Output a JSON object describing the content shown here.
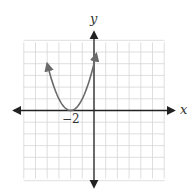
{
  "chart_data": {
    "type": "line",
    "title": "",
    "xlabel": "x",
    "ylabel": "y",
    "xlim": [
      -6,
      6
    ],
    "ylim": [
      -6,
      6
    ],
    "grid": true,
    "legend": "none",
    "tick_labels": [
      {
        "axis": "x",
        "value": -2,
        "label": "−2"
      }
    ],
    "series": [
      {
        "name": "parabola",
        "equation": "y = (x + 2)^2",
        "vertex": [
          -2,
          0
        ],
        "x": [
          -4.0,
          -3.5,
          -3.0,
          -2.5,
          -2.0,
          -1.5,
          -1.0,
          -0.5,
          0.0,
          0.2
        ],
        "y": [
          4.0,
          2.25,
          1.0,
          0.25,
          0.0,
          0.25,
          1.0,
          2.25,
          4.0,
          4.84
        ],
        "arrows_at_ends": true
      }
    ]
  },
  "labels": {
    "x_axis": "x",
    "y_axis": "y",
    "tick_neg2": "−2"
  },
  "colors": {
    "grid": "#d6d6d6",
    "axis": "#222222",
    "curve": "#6a6a6a"
  }
}
